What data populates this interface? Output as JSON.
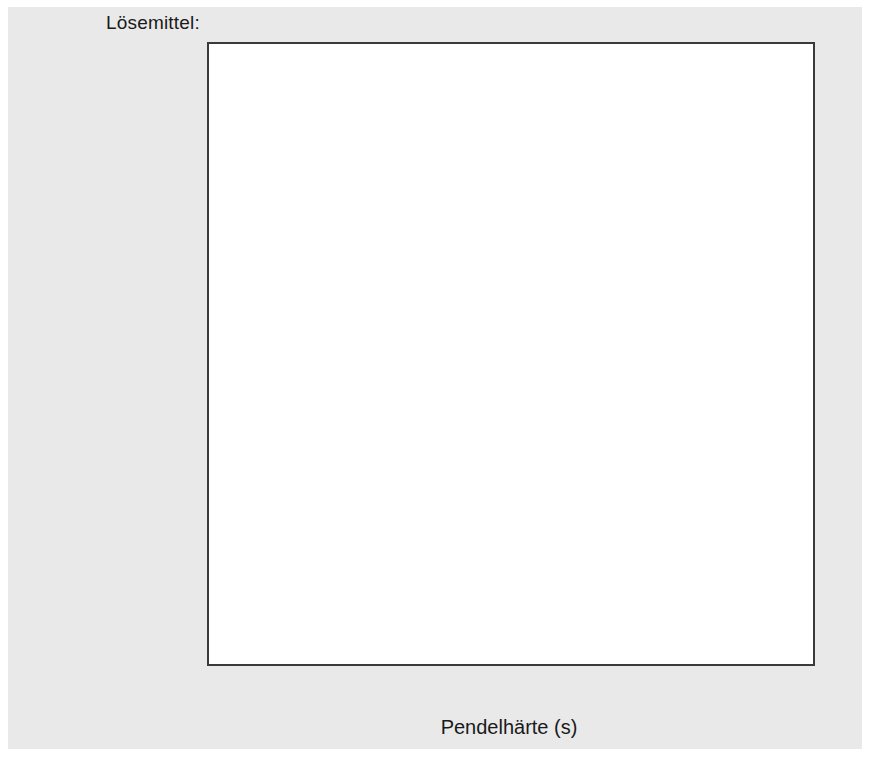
{
  "chart_data": {
    "type": "bar",
    "orientation": "horizontal",
    "stacked": true,
    "title": "",
    "group_header": "Lösemittel:",
    "xlabel": "Pendelhärte (s)",
    "ylabel": "",
    "xlim": [
      0,
      80
    ],
    "xticks": [
      0,
      10,
      20,
      30,
      40,
      50,
      60,
      70,
      80
    ],
    "xticklabels": [
      "0",
      "10",
      "20",
      "30",
      "40",
      "50",
      "60",
      "70",
      "80"
    ],
    "grid": false,
    "legend_position": "top-right",
    "categories": [
      "Lusolvan® FBHd",
      "Pine Öl",
      "Testbenzin (180 bis 210 °C)",
      "Hexylenglykol",
      "Shellsol Aa",
      "Butyldiglykolacetat",
      "Butyldiglykol",
      "Butylglykolacetat",
      "Butylglykol",
      "Ethylenglykol Propylenglykol",
      "Solvenon® PPd",
      "ohne Lösemittel"
    ],
    "category_lines": [
      [
        "Lusolvan® FBH",
        "d"
      ],
      [
        "Pine Öl"
      ],
      [
        "Testbenzin",
        "(180 bis 210 °C)"
      ],
      [
        "Hexylenglykol"
      ],
      [
        "Shellsol A",
        "a"
      ],
      [
        "Butyldiglykolacetat"
      ],
      [
        "Butyldiglykol"
      ],
      [
        "Butylglykolacetat"
      ],
      [
        "Butylglykol"
      ],
      [
        "Ethylenglykol",
        "Propylenglykol"
      ],
      [
        "Solvenon® PP",
        "d"
      ],
      [
        "ohne Lösemittel"
      ]
    ],
    "series": [
      {
        "name": "nach 1 Tag",
        "color": "#a9a9a9",
        "values": [
          7.0,
          7.0,
          8.1,
          9.4,
          9.7,
          3.0,
          7.0,
          10.3,
          20.5,
          47.4,
          46.4,
          64.1
        ]
      },
      {
        "name": "nach 7 Tagen",
        "color": "#6d6d6d",
        "values": [
          3.3,
          4.4,
          7.5,
          10.9,
          11.2,
          14.9,
          13.3,
          13.9,
          19.2,
          10.7,
          28.4,
          9.7
        ]
      },
      {
        "name": "nach 30 Tagen",
        "color": "#d2d2d2",
        "values": [
          4.4,
          5.8,
          6.8,
          11.9,
          15.5,
          19.8,
          20.1,
          19.0,
          22.0,
          10.4,
          5.5,
          5.9
        ]
      }
    ],
    "cumulative_totals": [
      [
        7.0,
        10.3,
        14.7
      ],
      [
        7.0,
        11.4,
        17.2
      ],
      [
        8.1,
        15.6,
        22.4
      ],
      [
        9.4,
        20.3,
        32.2
      ],
      [
        9.7,
        20.9,
        36.4
      ],
      [
        3.0,
        17.9,
        37.7
      ],
      [
        7.0,
        20.3,
        40.4
      ],
      [
        10.3,
        24.2,
        43.2
      ],
      [
        20.5,
        39.7,
        61.7
      ],
      [
        47.4,
        58.1,
        68.5
      ],
      [
        46.4,
        74.8,
        80.3
      ],
      [
        64.1,
        73.8,
        79.7
      ]
    ]
  },
  "legend": {
    "items": [
      {
        "label": "nach 1 Tag",
        "color": "#a9a9a9"
      },
      {
        "label": "nach 7 Tagen",
        "color": "#6d6d6d"
      },
      {
        "label": "nach 30 Tagen",
        "color": "#d2d2d2"
      }
    ]
  },
  "axis": {
    "x_title": "Pendelhärte (s)",
    "tick_labels": [
      "0",
      "10",
      "20",
      "30",
      "40",
      "50",
      "60",
      "70",
      "80"
    ]
  },
  "header": {
    "group_label": "Lösemittel:"
  }
}
